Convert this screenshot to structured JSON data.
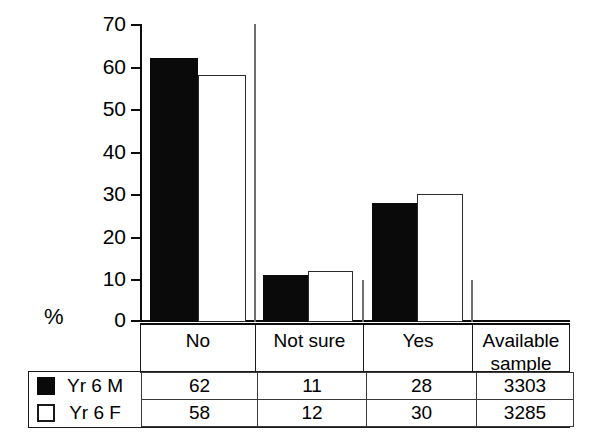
{
  "chart_data": {
    "type": "bar",
    "title": "",
    "subtitle": "",
    "xlabel": "",
    "ylabel": "%",
    "ylim": [
      0,
      70
    ],
    "yticks": [
      0,
      10,
      20,
      30,
      40,
      50,
      60,
      70
    ],
    "grid": false,
    "legend_position": "bottom-table",
    "categories": [
      "No",
      "Not sure",
      "Yes"
    ],
    "series": [
      {
        "name": "Yr 6 M",
        "values": [
          62,
          11,
          28
        ],
        "color": "#0a0a0a",
        "fill": "solid-black",
        "available_sample": 3303
      },
      {
        "name": "Yr 6 F",
        "values": [
          58,
          12,
          30
        ],
        "color": "#ffffff",
        "fill": "open-white",
        "available_sample": 3285
      }
    ],
    "annotations": []
  },
  "axis": {
    "ylabel": "%",
    "tick_labels": [
      "70",
      "60",
      "50",
      "40",
      "30",
      "20",
      "10",
      "0"
    ]
  },
  "category_band": {
    "cells": [
      "No",
      "Not sure",
      "Yes",
      "Available sample"
    ]
  },
  "table": {
    "rows": [
      {
        "swatch": "filled-square-icon",
        "series": "Yr 6 M",
        "values": [
          "62",
          "11",
          "28"
        ],
        "sample": "3303"
      },
      {
        "swatch": "open-square-icon",
        "series": "Yr 6 F",
        "values": [
          "58",
          "12",
          "30"
        ],
        "sample": "3285"
      }
    ]
  },
  "colors": {
    "ink": "#0d0d0d",
    "rule": "#1a1a1a",
    "series_m": "#0a0a0a",
    "series_f": "#ffffff",
    "background": "#ffffff"
  }
}
